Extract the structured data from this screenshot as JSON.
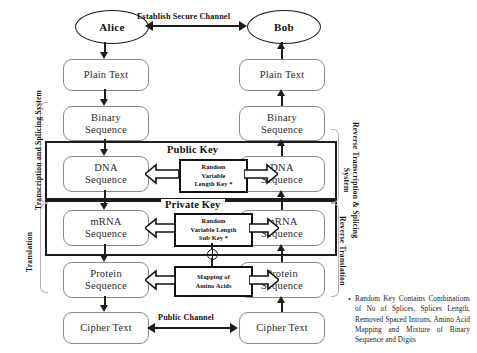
{
  "diagram": {
    "parties": {
      "left": "Alice",
      "right": "Bob"
    },
    "channels": {
      "secure": "Establish Secure Channel",
      "public": "Public Channel"
    },
    "left_pipeline": [
      {
        "line1": "Plain Text",
        "line2": ""
      },
      {
        "line1": "Binary",
        "line2": "Sequence"
      },
      {
        "line1": "DNA",
        "line2": "Sequence"
      },
      {
        "line1": "mRNA",
        "line2": "Sequence"
      },
      {
        "line1": "Protein",
        "line2": "Sequence"
      },
      {
        "line1": "Cipher Text",
        "line2": ""
      }
    ],
    "right_pipeline": [
      {
        "line1": "Plain Text",
        "line2": ""
      },
      {
        "line1": "Binary",
        "line2": "Sequence"
      },
      {
        "line1": "DNA",
        "line2": "Sequence"
      },
      {
        "line1": "mRNA",
        "line2": "Sequence"
      },
      {
        "line1": "Protein",
        "line2": "Sequence"
      },
      {
        "line1": "Cipher Text",
        "line2": ""
      }
    ],
    "key_groups": [
      {
        "id": "public-key",
        "title": "Public Key"
      },
      {
        "id": "private-key",
        "title": "Private Key"
      }
    ],
    "center_boxes": [
      {
        "id": "random-variable-length-key",
        "line1": "Random",
        "line2": "Variable",
        "line3": "Length Key *"
      },
      {
        "id": "random-variable-length-sub-key",
        "line1": "Random",
        "line2": "Variable Length",
        "line3": "Sub Key *"
      },
      {
        "id": "mapping-of-amino-acids",
        "line1": "Mapping of",
        "line2": "Amino Acids",
        "line3": ""
      }
    ],
    "side_labels": {
      "left_upper": "Transcription and Splicing System",
      "left_lower": "Translation",
      "right_upper_line1": "Reverse Transcription & Splicing",
      "right_upper_line2": "System",
      "right_lower": "Reverse Translation"
    },
    "footnote": {
      "bullet": "•",
      "text": "Random Key Contains Combinations of No of Splices, Splices Length, Removed Spaced Introns, Amino Acid Mapping and Mixture of Binary Sequence and Digits"
    },
    "colors": {
      "ink": "#1d1d1d",
      "node_stroke": "#8a8a8a",
      "bracket": "#b5b5b5",
      "background": "#ffffff"
    }
  }
}
